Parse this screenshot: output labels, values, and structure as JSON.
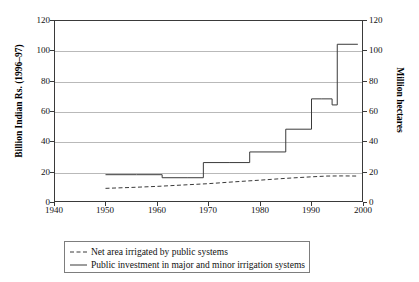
{
  "chart_data": {
    "type": "line",
    "title": "",
    "xlabel": "",
    "ylabel": "Billion Indian Rs. (1996–97)",
    "ylabel_right": "Million hectares",
    "xlim": [
      1940,
      2000
    ],
    "ylim": [
      0,
      120
    ],
    "xticks": [
      1940,
      1950,
      1960,
      1970,
      1980,
      1990,
      2000
    ],
    "yticks": [
      0,
      20,
      40,
      60,
      80,
      100,
      120
    ],
    "yticks_right": [
      0,
      20,
      40,
      60,
      80,
      100,
      120
    ],
    "grid": true,
    "legend_position": "below-plot",
    "series": [
      {
        "name": "Net area irrigated by public systems",
        "style": "dashed",
        "color": "#3a3a3a",
        "axis": "right",
        "unit": "Million hectares",
        "x": [
          1950,
          1955,
          1960,
          1965,
          1970,
          1975,
          1980,
          1985,
          1990,
          1993,
          1996,
          1999
        ],
        "values": [
          9.0,
          9.6,
          10.3,
          11.2,
          12.1,
          13.3,
          14.4,
          15.6,
          16.6,
          17.1,
          17.2,
          17.1
        ]
      },
      {
        "name": "Public investment in major and minor irrigation systems",
        "style": "solid",
        "color": "#3a3a3a",
        "axis": "left",
        "unit": "Billion Indian Rs. (1996–97)",
        "step": true,
        "x": [
          1950,
          1956,
          1961,
          1966,
          1969,
          1974,
          1978,
          1980,
          1985,
          1990,
          1992,
          1994,
          1995,
          1999
        ],
        "values": [
          18,
          18,
          16,
          16,
          26,
          26,
          33,
          33,
          48,
          68,
          68,
          64,
          104,
          104
        ]
      }
    ]
  },
  "axes": {
    "left_title": "Billion Indian Rs. (1996–97)",
    "right_title": "Million hectares",
    "y_ticks": [
      "0",
      "20",
      "40",
      "60",
      "80",
      "100",
      "120"
    ],
    "x_ticks": [
      "1940",
      "1950",
      "1960",
      "1970",
      "1980",
      "1990",
      "2000"
    ]
  },
  "legend": {
    "items": [
      {
        "label": "Net area irrigated by public systems",
        "style": "dashed"
      },
      {
        "label": "Public investment in major and minor irrigation systems",
        "style": "solid"
      }
    ]
  }
}
